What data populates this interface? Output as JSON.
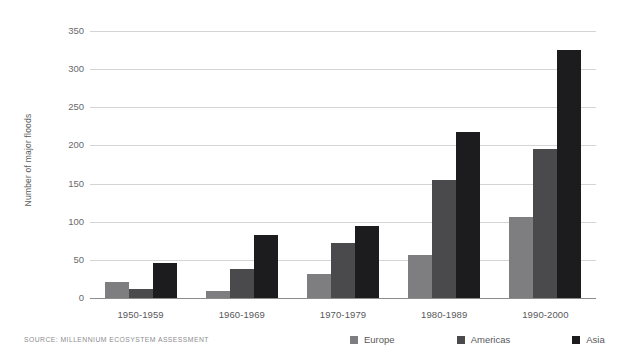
{
  "chart_data": {
    "type": "bar",
    "title": "",
    "subtitle": "",
    "xlabel": "",
    "ylabel": "Number of major floods",
    "ylim": [
      0,
      350
    ],
    "yticks": [
      0,
      50,
      100,
      150,
      200,
      250,
      300,
      350
    ],
    "ytick_labels": [
      "0",
      "50",
      "100",
      "150",
      "200",
      "250",
      "300",
      "350"
    ],
    "grid": true,
    "legend_position": "bottom-right",
    "categories": [
      "1950-1959",
      "1960-1969",
      "1970-1979",
      "1980-1989",
      "1990-2000"
    ],
    "series": [
      {
        "name": "Europe",
        "color": "#7e7e80",
        "values": [
          21,
          9,
          31,
          57,
          106
        ]
      },
      {
        "name": "Americas",
        "color": "#4a4a4c",
        "values": [
          12,
          38,
          72,
          155,
          195
        ]
      },
      {
        "name": "Asia",
        "color": "#1c1c1e",
        "values": [
          46,
          82,
          95,
          218,
          325
        ]
      }
    ],
    "source": "SOURCE: MILLENNIUM ECOSYSTEM ASSESSMENT"
  }
}
